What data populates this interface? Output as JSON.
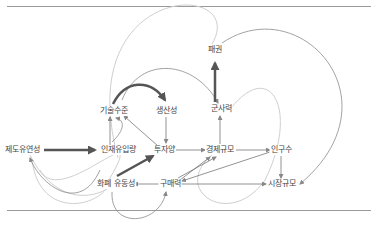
{
  "diagram": {
    "type": "causal-loop",
    "colors": {
      "rule": "#9a9a9a",
      "edge": "#777777",
      "edge_light": "#c8c8c8",
      "edge_strong": "#555555",
      "text": "#444444"
    },
    "nodes": [
      {
        "id": "hegemony",
        "label": "패권",
        "x": 215,
        "y": 50
      },
      {
        "id": "military",
        "label": "군사력",
        "x": 221,
        "y": 109
      },
      {
        "id": "tech",
        "label": "기술수준",
        "x": 114,
        "y": 111
      },
      {
        "id": "productivity",
        "label": "생산성",
        "x": 166,
        "y": 111
      },
      {
        "id": "institution",
        "label": "제도유연성",
        "x": 22,
        "y": 150
      },
      {
        "id": "talent",
        "label": "인재유입량",
        "x": 118,
        "y": 150
      },
      {
        "id": "investment",
        "label": "투자양",
        "x": 164,
        "y": 150
      },
      {
        "id": "economy",
        "label": "경제규모",
        "x": 220,
        "y": 150
      },
      {
        "id": "population",
        "label": "인구수",
        "x": 281,
        "y": 150
      },
      {
        "id": "liquidity",
        "label": "화폐 유동성",
        "x": 116,
        "y": 184
      },
      {
        "id": "purchasing",
        "label": "구매력",
        "x": 170,
        "y": 184
      },
      {
        "id": "market",
        "label": "시장규모",
        "x": 282,
        "y": 184
      }
    ]
  }
}
